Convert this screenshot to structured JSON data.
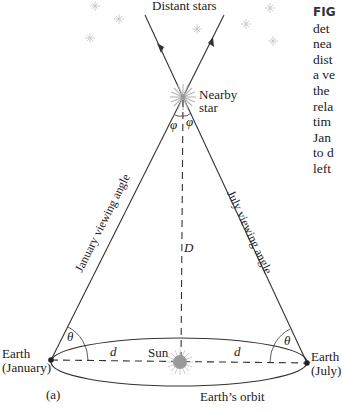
{
  "figure": {
    "panel_label": "(a)",
    "labels": {
      "distant_stars": "Distant stars",
      "nearby_star_line1": "Nearby",
      "nearby_star_line2": "star",
      "phi_left": "φ",
      "phi_right": "φ",
      "theta_left": "θ",
      "theta_right": "θ",
      "distance_D": "D",
      "d_left": "d",
      "d_right": "d",
      "sun": "Sun",
      "earth_jan_line1": "Earth",
      "earth_jan_line2": "(January)",
      "earth_jul_line1": "Earth",
      "earth_jul_line2": "(July)",
      "orbit": "Earth’s orbit",
      "january_viewing_angle": "January viewing angle",
      "july_viewing_angle": "July viewing angle"
    },
    "caption_fragments": [
      "FIG",
      "det",
      "nea",
      "dist",
      "a ve",
      "the",
      "rela",
      "tim",
      "Jan",
      "to d",
      "left"
    ],
    "colors": {
      "line": "#333333",
      "star_glyph": "#bbbbbb",
      "sun_fill": "#9a9a9a",
      "text": "#222222"
    }
  }
}
